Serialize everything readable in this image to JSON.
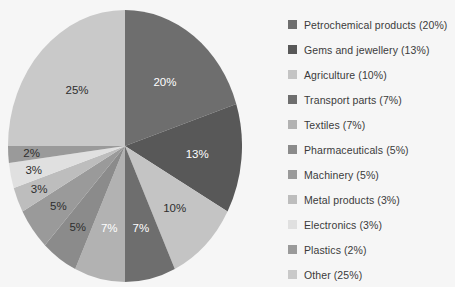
{
  "chart_data": {
    "type": "pie",
    "title": "",
    "legend_position": "right",
    "labels": [
      "Petrochemical products",
      "Gems and jewellery",
      "Agriculture",
      "Transport parts",
      "Textiles",
      "Pharmaceuticals",
      "Machinery",
      "Metal products",
      "Electronics",
      "Plastics",
      "Other"
    ],
    "values": [
      20,
      13,
      10,
      7,
      7,
      5,
      5,
      3,
      3,
      2,
      25
    ],
    "value_labels": [
      "20%",
      "13%",
      "10%",
      "7%",
      "7%",
      "5%",
      "5%",
      "3%",
      "3%",
      "2%",
      "25%"
    ],
    "colors": [
      "#6e6e6e",
      "#585858",
      "#c4c4c4",
      "#6e6e6e",
      "#b2b2b2",
      "#8b8b8b",
      "#9a9a9a",
      "#bdbdbd",
      "#e0e0e0",
      "#9a9a9a",
      "#c9c9c9"
    ],
    "label_text_colors": [
      "light",
      "light",
      "dark",
      "light",
      "light",
      "dark",
      "dark",
      "dark",
      "dark",
      "dark",
      "dark"
    ],
    "legend": [
      {
        "label": "Petrochemical products (20%)",
        "color": "#6e6e6e"
      },
      {
        "label": "Gems and jewellery (13%)",
        "color": "#585858"
      },
      {
        "label": "Agriculture (10%)",
        "color": "#c4c4c4"
      },
      {
        "label": "Transport parts (7%)",
        "color": "#6e6e6e"
      },
      {
        "label": "Textiles (7%)",
        "color": "#b2b2b2"
      },
      {
        "label": "Pharmaceuticals (5%)",
        "color": "#8b8b8b"
      },
      {
        "label": "Machinery (5%)",
        "color": "#9a9a9a"
      },
      {
        "label": "Metal products (3%)",
        "color": "#bdbdbd"
      },
      {
        "label": "Electronics (3%)",
        "color": "#e0e0e0"
      },
      {
        "label": "Plastics (2%)",
        "color": "#9a9a9a"
      },
      {
        "label": "Other (25%)",
        "color": "#c9c9c9"
      }
    ],
    "background_color": "#f6f6f6"
  }
}
